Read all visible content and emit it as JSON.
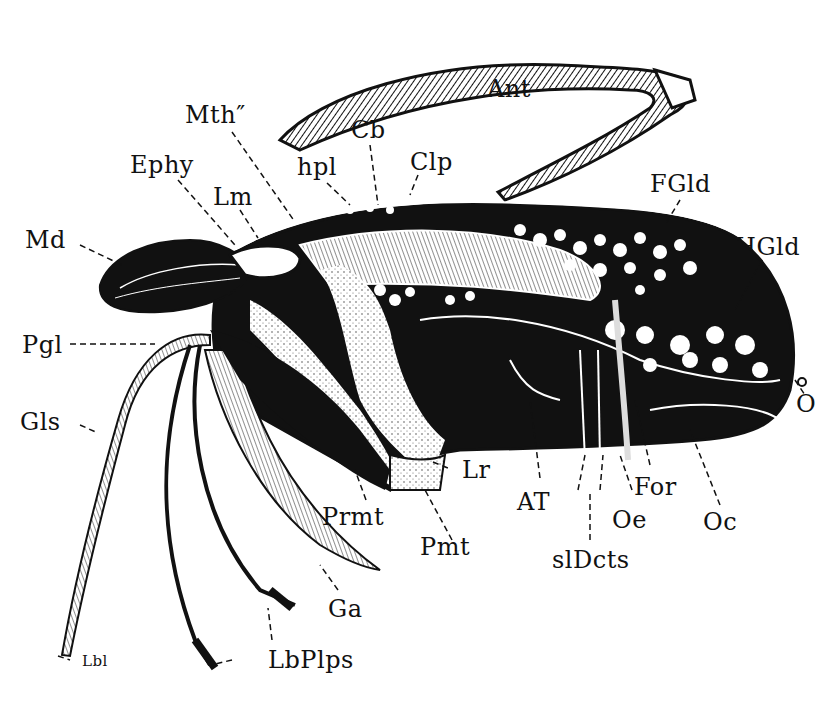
{
  "figure": {
    "colors": {
      "ink": "#111111",
      "paper": "#ffffff",
      "stipple": "#dddddd"
    }
  },
  "labels": {
    "ant": "Ant",
    "mth": "Mth″",
    "cb": "Cb",
    "clp": "Clp",
    "hpl": "hpl",
    "ephy": "Ephy",
    "lm": "Lm",
    "md": "Md",
    "fgld": "FGld",
    "hgld": "HGld",
    "pgl": "Pgl",
    "gls": "Gls",
    "o": "O",
    "lr": "Lr",
    "at": "AT",
    "for": "For",
    "oe": "Oe",
    "oc": "Oc",
    "prmt": "Prmt",
    "pmt": "Pmt",
    "sldcts": "slDcts",
    "ga": "Ga",
    "lbplps": "LbPlps",
    "lbl": "Lbl"
  }
}
